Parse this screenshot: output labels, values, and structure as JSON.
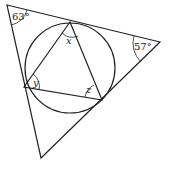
{
  "diagram": {
    "type": "geometry",
    "outer_triangle": {
      "vertices": [
        [
          7,
          5
        ],
        [
          160,
          42
        ],
        [
          41,
          158
        ]
      ],
      "angles": [
        {
          "vertex": "top-left",
          "label": "63°"
        },
        {
          "vertex": "right",
          "label": "57°"
        }
      ]
    },
    "incircle": {
      "cx": 70,
      "cy": 68,
      "r": 45
    },
    "inner_triangle": {
      "vertices": [
        [
          70,
          22
        ],
        [
          24,
          87
        ],
        [
          102,
          100
        ]
      ],
      "angles": [
        {
          "vertex": "top",
          "label": "x"
        },
        {
          "vertex": "left",
          "label": "y"
        },
        {
          "vertex": "bottom-right",
          "label": "z"
        }
      ]
    },
    "colors": {
      "stroke": "#222222",
      "background": "#ffffff"
    }
  }
}
